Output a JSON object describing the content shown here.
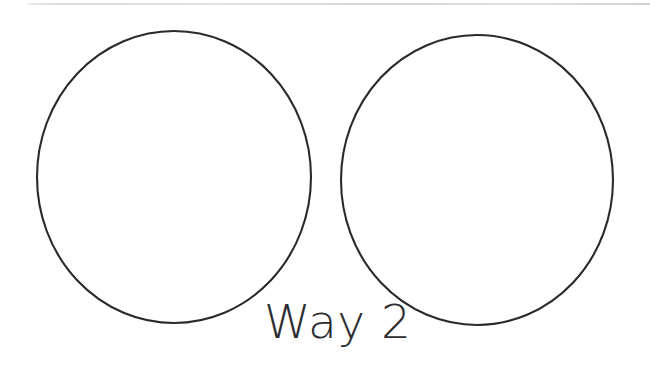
{
  "page": {
    "background_color": "#ffffff",
    "width": 650,
    "height": 391
  },
  "top_rule": {
    "name": "page-edge-rule",
    "color": "#dcdcde",
    "visible": true
  },
  "diagram": {
    "title": "Way 2",
    "caption": "Way 2",
    "stroke_color": "#2a2a2e",
    "stroke_width": "2px",
    "fill": "none",
    "shapes": [
      {
        "id": "circle-left",
        "label": "Left circle",
        "center_x": 174,
        "center_y": 177,
        "radius_x": 137,
        "radius_y": 146
      },
      {
        "id": "circle-right",
        "label": "Right circle",
        "center_x": 477,
        "center_y": 180,
        "radius_x": 136,
        "radius_y": 145
      }
    ]
  }
}
